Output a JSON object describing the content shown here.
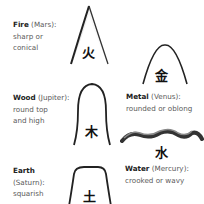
{
  "elements": [
    {
      "key": "fire",
      "name": "Fire",
      "planet": "(Mars):",
      "desc_line1": "sharp or",
      "desc_line2": "conical",
      "glyph": "火"
    },
    {
      "key": "metal",
      "name": "Metal",
      "planet": "(Venus):",
      "desc_line1": "rounded or oblong",
      "glyph": "金"
    },
    {
      "key": "wood",
      "name": "Wood",
      "planet": "(Jupiter):",
      "desc_line1": "round top",
      "desc_line2": "and high",
      "glyph": "木"
    },
    {
      "key": "water",
      "name": "Water",
      "planet": "(Mercury):",
      "desc_line1": "crooked or wavy",
      "glyph": "水"
    },
    {
      "key": "earth",
      "name": "Earth",
      "planet_line": "(Saturn):",
      "desc_line1": "squarish",
      "glyph": "土"
    }
  ]
}
